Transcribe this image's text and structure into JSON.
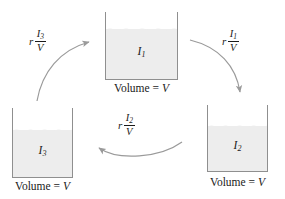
{
  "diagram": {
    "colors": {
      "liquid_fill": "#ededed",
      "outline": "#8f8f8f",
      "arrow": "#9a9a9a",
      "text": "#1a1a1a",
      "background": "#ffffff"
    },
    "containers": [
      {
        "id": "top",
        "quantity_symbol": "I",
        "quantity_subscript": "1",
        "volume_caption_prefix": "Volume = ",
        "volume_caption_value": "V"
      },
      {
        "id": "bottom-left",
        "quantity_symbol": "I",
        "quantity_subscript": "3",
        "volume_caption_prefix": "Volume = ",
        "volume_caption_value": "V"
      },
      {
        "id": "bottom-right",
        "quantity_symbol": "I",
        "quantity_subscript": "2",
        "volume_caption_prefix": "Volume = ",
        "volume_caption_value": "V"
      }
    ],
    "flows": [
      {
        "id": "flow-3-to-1",
        "from": "bottom-left",
        "to": "top",
        "rate_coefficient": "r",
        "numerator_symbol": "I",
        "numerator_subscript": "3",
        "denominator": "V"
      },
      {
        "id": "flow-1-to-2",
        "from": "top",
        "to": "bottom-right",
        "rate_coefficient": "r",
        "numerator_symbol": "I",
        "numerator_subscript": "1",
        "denominator": "V"
      },
      {
        "id": "flow-2-to-3",
        "from": "bottom-right",
        "to": "bottom-left",
        "rate_coefficient": "r",
        "numerator_symbol": "I",
        "numerator_subscript": "2",
        "denominator": "V"
      }
    ]
  }
}
